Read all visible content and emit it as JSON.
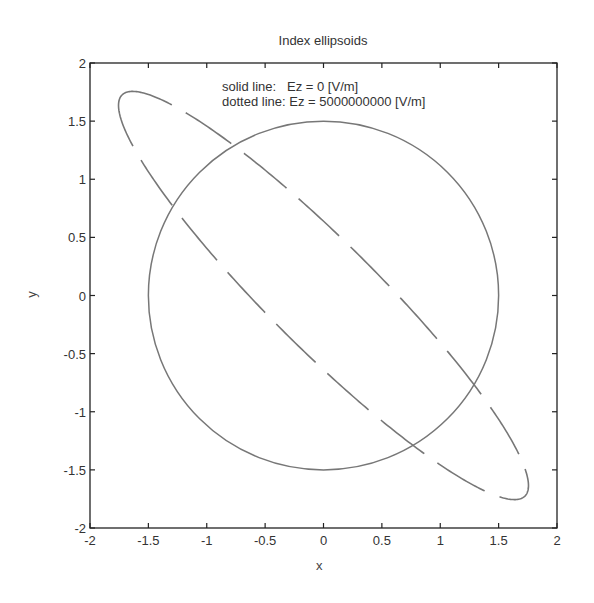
{
  "chart_data": {
    "type": "line",
    "title": "Index ellipsoids",
    "xlabel": "x",
    "ylabel": "y",
    "xlim": [
      -2,
      2
    ],
    "ylim": [
      -2,
      2
    ],
    "grid": false,
    "box": true,
    "xticks": [
      -2,
      -1.5,
      -1,
      -0.5,
      0,
      0.5,
      1,
      1.5,
      2
    ],
    "yticks": [
      -2,
      -1.5,
      -1,
      -0.5,
      0,
      0.5,
      1,
      1.5,
      2
    ],
    "xtick_labels": [
      "-2",
      "-1.5",
      "-1",
      "-0.5",
      "0",
      "0.5",
      "1",
      "1.5",
      "2"
    ],
    "ytick_labels": [
      "-2",
      "-1.5",
      "-1",
      "-0.5",
      "0",
      "0.5",
      "1",
      "1.5",
      "2"
    ],
    "annotations": [
      "solid line:   Ez = 0 [V/m]",
      "dotted line: Ez = 5000000000 [V/m]"
    ],
    "series": [
      {
        "name": "Ez = 0 [V/m]",
        "style": "solid",
        "shape": "circle",
        "center": [
          0,
          0
        ],
        "radius": 1.5,
        "color": "#777777"
      },
      {
        "name": "Ez = 5000000000 [V/m]",
        "style": "dashed",
        "shape": "ellipse",
        "center": [
          0,
          0
        ],
        "semi_major": 2.44,
        "semi_minor": 0.46,
        "rotation_deg": 135,
        "color": "#777777"
      }
    ]
  },
  "layout": {
    "plot_left": 90,
    "plot_top": 63,
    "plot_width": 467,
    "plot_height": 465,
    "axis_color": "#222222",
    "line_color": "#777777"
  }
}
